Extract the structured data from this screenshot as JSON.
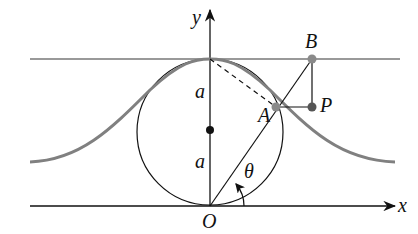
{
  "diagram": {
    "labels": {
      "y": "y",
      "x": "x",
      "B": "B",
      "A": "A",
      "P": "P",
      "O": "O",
      "theta": "θ",
      "a_upper": "a",
      "a_lower": "a"
    },
    "colors": {
      "curve": "#808080",
      "lines": "#111111",
      "top_line": "#777777",
      "points": "#7a7a7a"
    }
  }
}
